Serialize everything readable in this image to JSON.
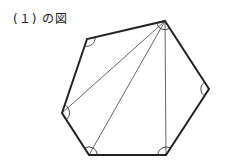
{
  "caption": "(１) の図",
  "figure": {
    "shape": "hexagon",
    "vertices": [
      [
        165,
        21
      ],
      [
        209,
        89
      ],
      [
        166,
        155
      ],
      [
        89,
        155
      ],
      [
        62,
        113
      ],
      [
        87,
        39
      ]
    ],
    "diagonals_from": 0,
    "diagonals_to": [
      4,
      3,
      2
    ],
    "angle_marks": 6,
    "stroke": "#222222",
    "diagonal_stroke": "#555555"
  }
}
